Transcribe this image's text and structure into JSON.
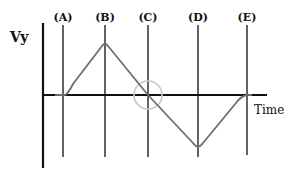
{
  "diagram": {
    "type": "velocity-time graph",
    "y_axis_label": "Vy",
    "x_axis_label": "Time",
    "markers": [
      {
        "label": "(A)",
        "x": 63
      },
      {
        "label": "(B)",
        "x": 105
      },
      {
        "label": "(C)",
        "x": 148
      },
      {
        "label": "(D)",
        "x": 198
      },
      {
        "label": "(E)",
        "x": 247
      }
    ],
    "highlight": {
      "marker": "(C)",
      "description": "circle at zero crossing"
    },
    "colors": {
      "axis": "#111111",
      "curve": "#6e6e6e",
      "marker_line": "#222222",
      "highlight_circle": "#c8c8c8",
      "background": "#ffffff"
    }
  }
}
